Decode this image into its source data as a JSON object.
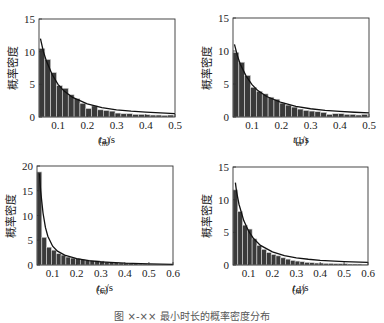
{
  "figure": {
    "caption": "图 ×-×× 最小时长的概率密度分布"
  },
  "chart_data": [
    {
      "type": "bar",
      "panel_label": "(a)",
      "title": "",
      "xlabel": "t_m/s",
      "ylabel": "概率密度",
      "xlim": [
        0.035,
        0.5
      ],
      "ylim": [
        0,
        15
      ],
      "xticks": [
        0.1,
        0.2,
        0.3,
        0.4,
        0.5
      ],
      "yticks": [
        0,
        5,
        10,
        15
      ],
      "bin_width": 0.02,
      "bin_starts": [
        0.035,
        0.055,
        0.075,
        0.095,
        0.115,
        0.135,
        0.155,
        0.175,
        0.195,
        0.215,
        0.235,
        0.255,
        0.275,
        0.295,
        0.315,
        0.335,
        0.355,
        0.375,
        0.395,
        0.415,
        0.435,
        0.455,
        0.475
      ],
      "values": [
        10.5,
        8.8,
        6.8,
        4.8,
        4.4,
        3.4,
        2.8,
        2.1,
        1.3,
        1.7,
        1.1,
        1.0,
        0.9,
        0.6,
        0.5,
        0.5,
        0.4,
        0.4,
        0.35,
        0.3,
        0.3,
        0.25,
        0.3
      ],
      "fit_curve": {
        "x": [
          0.04,
          0.05,
          0.06,
          0.08,
          0.1,
          0.12,
          0.15,
          0.2,
          0.25,
          0.3,
          0.35,
          0.4,
          0.45,
          0.5
        ],
        "y": [
          12.0,
          10.0,
          8.6,
          6.5,
          5.0,
          4.0,
          3.0,
          2.0,
          1.45,
          1.1,
          0.9,
          0.75,
          0.62,
          0.52
        ]
      },
      "grid": false
    },
    {
      "type": "bar",
      "panel_label": "(b)",
      "title": "",
      "xlabel": "t_m/s",
      "ylabel": "概率密度",
      "xlim": [
        0.035,
        0.5
      ],
      "ylim": [
        0,
        15
      ],
      "xticks": [
        0.1,
        0.2,
        0.3,
        0.4,
        0.5
      ],
      "yticks": [
        0,
        5,
        10,
        15
      ],
      "bin_width": 0.02,
      "bin_starts": [
        0.035,
        0.055,
        0.075,
        0.095,
        0.115,
        0.135,
        0.155,
        0.175,
        0.195,
        0.215,
        0.235,
        0.255,
        0.275,
        0.295,
        0.315,
        0.335,
        0.355,
        0.375,
        0.395,
        0.415,
        0.435,
        0.455,
        0.475
      ],
      "values": [
        9.8,
        8.3,
        6.3,
        4.5,
        3.9,
        3.5,
        3.0,
        2.7,
        2.1,
        1.8,
        1.5,
        1.2,
        1.0,
        0.9,
        0.8,
        0.7,
        0.4,
        0.5,
        0.5,
        0.4,
        0.4,
        0.3,
        0.4
      ],
      "fit_curve": {
        "x": [
          0.04,
          0.05,
          0.06,
          0.08,
          0.1,
          0.12,
          0.15,
          0.2,
          0.25,
          0.3,
          0.35,
          0.4,
          0.45,
          0.5
        ],
        "y": [
          11.0,
          9.3,
          8.0,
          6.2,
          4.9,
          4.0,
          3.1,
          2.2,
          1.6,
          1.25,
          1.0,
          0.85,
          0.72,
          0.62
        ]
      },
      "grid": false
    },
    {
      "type": "bar",
      "panel_label": "(c)",
      "title": "",
      "xlabel": "t_m/s",
      "ylabel": "概率密度",
      "xlim": [
        0.035,
        0.6
      ],
      "ylim": [
        0,
        20
      ],
      "xticks": [
        0.1,
        0.2,
        0.3,
        0.4,
        0.5,
        0.6
      ],
      "yticks": [
        0,
        5,
        10,
        15,
        20
      ],
      "bin_width": 0.02,
      "bin_starts": [
        0.035,
        0.055,
        0.075,
        0.095,
        0.115,
        0.135,
        0.155,
        0.175,
        0.195,
        0.215,
        0.235,
        0.255,
        0.275,
        0.295,
        0.315,
        0.335,
        0.355,
        0.375,
        0.395,
        0.415,
        0.435,
        0.455,
        0.475,
        0.495,
        0.515,
        0.535,
        0.555,
        0.575
      ],
      "values": [
        18.8,
        5.6,
        3.6,
        3.0,
        2.3,
        2.0,
        1.6,
        1.4,
        1.3,
        1.1,
        1.0,
        0.9,
        0.9,
        0.8,
        0.6,
        0.5,
        0.45,
        0.4,
        0.4,
        0.3,
        0.3,
        0.2,
        0.2,
        0.15,
        0.15,
        0.1,
        0.1,
        0.1
      ],
      "fit_curve": {
        "x": [
          0.045,
          0.05,
          0.06,
          0.07,
          0.08,
          0.1,
          0.12,
          0.15,
          0.2,
          0.25,
          0.3,
          0.4,
          0.5,
          0.6
        ],
        "y": [
          18.5,
          15.0,
          10.5,
          7.6,
          5.8,
          3.8,
          2.8,
          2.0,
          1.3,
          0.9,
          0.65,
          0.38,
          0.22,
          0.14
        ]
      },
      "grid": false
    },
    {
      "type": "bar",
      "panel_label": "(d)",
      "title": "",
      "xlabel": "t_m/s",
      "ylabel": "概率密度",
      "xlim": [
        0.035,
        0.6
      ],
      "ylim": [
        0,
        15
      ],
      "xticks": [
        0.1,
        0.2,
        0.3,
        0.4,
        0.5,
        0.6
      ],
      "yticks": [
        0,
        5,
        10,
        15
      ],
      "bin_width": 0.02,
      "bin_starts": [
        0.035,
        0.055,
        0.075,
        0.095,
        0.115,
        0.135,
        0.155,
        0.175,
        0.195,
        0.215,
        0.235,
        0.255,
        0.275,
        0.295,
        0.315,
        0.335,
        0.355,
        0.375,
        0.395,
        0.415,
        0.435,
        0.455,
        0.475,
        0.495,
        0.515,
        0.535,
        0.555,
        0.575
      ],
      "values": [
        11.5,
        8.2,
        6.1,
        5.5,
        4.0,
        3.0,
        2.4,
        1.9,
        1.6,
        1.4,
        1.1,
        0.9,
        0.7,
        0.6,
        0.5,
        0.4,
        0.35,
        0.3,
        0.3,
        0.25,
        0.25,
        0.2,
        0.2,
        0.2,
        0.15,
        0.15,
        0.15,
        0.1
      ],
      "fit_curve": {
        "x": [
          0.045,
          0.05,
          0.06,
          0.08,
          0.1,
          0.12,
          0.15,
          0.2,
          0.25,
          0.3,
          0.35,
          0.4,
          0.5,
          0.6
        ],
        "y": [
          12.6,
          11.2,
          9.3,
          6.8,
          5.2,
          4.1,
          3.0,
          2.0,
          1.45,
          1.1,
          0.88,
          0.72,
          0.52,
          0.4
        ]
      },
      "grid": false
    }
  ]
}
